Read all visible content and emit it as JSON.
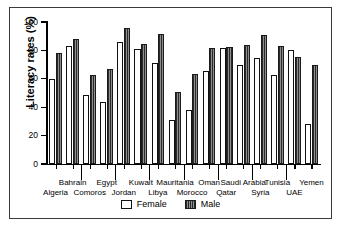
{
  "chart_data": {
    "type": "bar",
    "title": "",
    "xlabel": "",
    "ylabel": "Literacy rates (%)",
    "ylim": [
      0,
      100
    ],
    "yticks": [
      0,
      20,
      40,
      60,
      80,
      100
    ],
    "grid": false,
    "legend_position": "bottom-center",
    "categories": [
      "Algeria",
      "Bahrain",
      "Comoros",
      "Egypt",
      "Jordan",
      "Kuwait",
      "Libya",
      "Mauritania",
      "Morocco",
      "Oman",
      "Qatar",
      "Saudi Arabia",
      "Syria",
      "Tunisia",
      "UAE",
      "Yemen"
    ],
    "series": [
      {
        "name": "Female",
        "color": "#ffffff",
        "values": [
          60,
          83,
          48.5,
          43.5,
          86,
          81,
          71,
          31,
          38,
          65.5,
          82,
          69.5,
          74.5,
          63,
          80.5,
          28.5
        ]
      },
      {
        "name": "Male",
        "color": "#5d5d5d",
        "values": [
          78,
          88,
          63,
          67,
          95.5,
          84.5,
          91.5,
          51,
          63.5,
          82,
          82.5,
          84,
          91,
          83,
          75.5,
          69.5
        ]
      }
    ],
    "label_rows": {
      "top": [
        "Bahrain",
        "Egypt",
        "Kuwait",
        "Mauritania",
        "Oman",
        "Saudi Arabia",
        "Tunisia",
        "Yemen"
      ],
      "bottom": [
        "Algeria",
        "Comoros",
        "Jordan",
        "Libya",
        "Morocco",
        "Qatar",
        "Syria",
        "UAE"
      ]
    }
  },
  "legend": {
    "female_label": "Female",
    "male_label": "Male"
  },
  "axis": {
    "y_title": "Literacy rates (%)",
    "tick_100": "100",
    "tick_80": "80",
    "tick_60": "60",
    "tick_40": "40",
    "tick_20": "20",
    "tick_0": "0"
  }
}
